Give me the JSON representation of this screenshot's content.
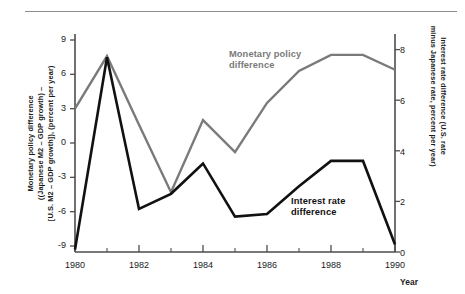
{
  "figure": {
    "axis_titles": {
      "left": "Monetary policy difference ((Japanese M2 – GDP growth) – [U.S. M2 – GDP growth]), (percent per year)",
      "left_line1": "Monetary policy difference",
      "left_line2": "((Japanese M2 – GDP growth) –",
      "left_line3": "[U.S. M2 – GDP growth]), (percent per year)",
      "right_line1": "Interest rate difference (U.S. rate",
      "right_line2": "minus Japanese rate, percent per year)",
      "x": "Year"
    },
    "colors": {
      "monetary_policy_line": "#7a7a7a",
      "interest_rate_line": "#111111",
      "axis": "#4d4d4d",
      "rule": "#8d8d8d"
    }
  },
  "chart_data": {
    "type": "line",
    "title": "",
    "xlabel": "Year",
    "ylabel": "Monetary policy difference ((Japanese M2 – GDP growth) – [U.S. M2 – GDP growth]), (percent per year)",
    "ylabel_right": "Interest rate difference (U.S. rate minus Japanese rate, percent per year)",
    "grid": false,
    "legend": "inline-annotations",
    "x": [
      1980,
      1981,
      1982,
      1983,
      1984,
      1985,
      1986,
      1987,
      1988,
      1989,
      1990
    ],
    "xlim": [
      1980,
      1990
    ],
    "xticks": [
      1980,
      1982,
      1984,
      1986,
      1988,
      1990
    ],
    "xtick_labels": [
      "1980",
      "1982",
      "1984",
      "1986",
      "1988",
      "1990"
    ],
    "xminor_ticks": [
      1981,
      1983,
      1985,
      1987,
      1989
    ],
    "ylim": [
      -9,
      9
    ],
    "yticks": [
      9,
      6,
      3,
      0,
      -3,
      -6,
      -9
    ],
    "ytick_labels": [
      "9",
      "6",
      "3",
      "0",
      "-3",
      "-6",
      "-9"
    ],
    "ylim_right": [
      0,
      9
    ],
    "yticks_right": [
      0,
      2,
      4,
      6,
      8
    ],
    "ytick_labels_right": [
      "0",
      "2",
      "4",
      "6",
      "8"
    ],
    "series": [
      {
        "name": "Monetary policy difference",
        "axis": "left",
        "color": "#7a7a7a",
        "values": [
          3.0,
          7.6,
          1.6,
          -4.3,
          2.0,
          -0.8,
          3.5,
          6.3,
          7.7,
          7.7,
          6.4
        ]
      },
      {
        "name": "Interest rate difference",
        "axis": "right",
        "color": "#111111",
        "values": [
          0.1,
          7.7,
          1.7,
          2.3,
          3.5,
          1.4,
          1.5,
          2.6,
          3.6,
          3.6,
          0.3
        ]
      }
    ],
    "annotations": [
      {
        "text": "Monetary policy difference",
        "series": "Monetary policy difference"
      },
      {
        "text": "Interest rate difference",
        "series": "Interest rate difference"
      }
    ]
  },
  "ticks": {
    "left": [
      "9",
      "6",
      "3",
      "0",
      "-3",
      "-6",
      "-9"
    ],
    "right": [
      "8",
      "6",
      "4",
      "2",
      "0"
    ],
    "x": [
      "1980",
      "1982",
      "1984",
      "1986",
      "1988",
      "1990"
    ]
  },
  "labels": {
    "monetary_line1": "Monetary policy",
    "monetary_line2": "difference",
    "interest_line1": "Interest rate",
    "interest_line2": "difference"
  }
}
